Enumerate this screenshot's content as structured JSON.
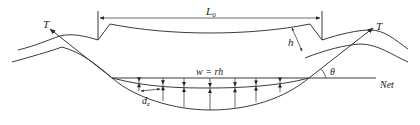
{
  "diagram": {
    "labels": {
      "span": "L₀",
      "span_main": "L",
      "span_sub": "0",
      "height": "h",
      "load": "w = rh",
      "tension_left": "T",
      "tension_right": "T",
      "angle": "θ",
      "net": "Net",
      "displacement_main": "d",
      "displacement_sub": "z"
    },
    "load_arrow_count": 7,
    "colors": {
      "line": "#3a3a3a",
      "background": "#ffffff"
    }
  }
}
